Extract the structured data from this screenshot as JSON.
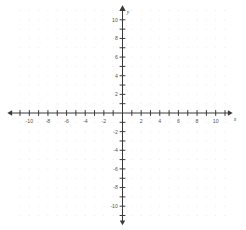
{
  "chart_data": {
    "type": "scatter",
    "title": "",
    "subtitle": "",
    "xlabel": "x",
    "ylabel": "y",
    "xlim": [
      -11,
      11
    ],
    "ylim": [
      -11,
      11
    ],
    "grid": true,
    "grid_style": "dots",
    "legend": "none",
    "series": [
      {
        "name": "points",
        "x": [],
        "y": []
      }
    ],
    "x_tick_interval": 1,
    "y_tick_interval": 1,
    "x_label_interval": 2,
    "y_label_interval": 2,
    "x_tick_labels": [
      "-10",
      "-8",
      "-6",
      "-4",
      "-2",
      "2",
      "4",
      "6",
      "8",
      "10"
    ],
    "x_tick_values": [
      -10,
      -8,
      -6,
      -4,
      -2,
      2,
      4,
      6,
      8,
      10
    ],
    "y_tick_labels": [
      "10",
      "8",
      "6",
      "4",
      "2",
      "-2",
      "-4",
      "-6",
      "-8",
      "-10"
    ],
    "y_tick_values": [
      10,
      8,
      6,
      4,
      2,
      -2,
      -4,
      -6,
      -8,
      -10
    ],
    "annotations": []
  },
  "axes": {
    "x_axis_name": "x",
    "y_axis_name": "y",
    "origin_label": "",
    "arrowheads": "both-ends",
    "axis_color": "#3a3a3a",
    "tick_color": "#3a3a3a",
    "grid_dot_color": "#e8e8ea",
    "label_color": "#555555",
    "background_color": "#ffffff"
  }
}
